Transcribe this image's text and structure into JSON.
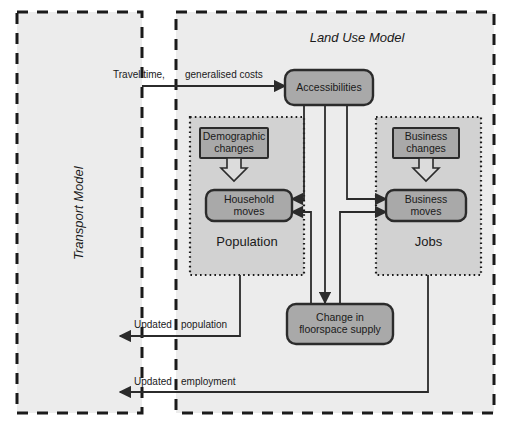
{
  "diagram": {
    "containers": [
      {
        "id": "transport-model",
        "label": "Transport Model",
        "style": "dashed",
        "orientation": "vertical"
      },
      {
        "id": "land-use-model",
        "label": "Land Use Model",
        "style": "dashed",
        "orientation": "horizontal"
      }
    ],
    "subzones": [
      {
        "id": "population",
        "label": "Population",
        "style": "dotted"
      },
      {
        "id": "jobs",
        "label": "Jobs",
        "style": "dotted"
      }
    ],
    "nodes": [
      {
        "id": "accessibilities",
        "label": "Accessibilities",
        "shape": "rounded"
      },
      {
        "id": "demographic-changes",
        "label_line1": "Demographic",
        "label_line2": "changes",
        "shape": "rect"
      },
      {
        "id": "household-moves",
        "label_line1": "Household",
        "label_line2": "moves",
        "shape": "rounded"
      },
      {
        "id": "business-changes",
        "label_line1": "Business",
        "label_line2": "changes",
        "shape": "rect"
      },
      {
        "id": "business-moves",
        "label_line1": "Business",
        "label_line2": "moves",
        "shape": "rounded"
      },
      {
        "id": "change-in-floorspace-supply",
        "label_line1": "Change in",
        "label_line2": "floorspace supply",
        "shape": "rounded"
      }
    ],
    "flows": [
      {
        "id": "travel-time-costs",
        "label_part1": "Travel time,",
        "label_part2": "generalised costs",
        "from": "transport-model",
        "to": "accessibilities"
      },
      {
        "id": "updated-population",
        "label_part1": "Updated",
        "label_part2": "population",
        "from": "population",
        "to": "transport-model"
      },
      {
        "id": "updated-employment",
        "label_part1": "Updated",
        "label_part2": "employment",
        "from": "jobs",
        "to": "transport-model"
      }
    ],
    "colors": {
      "node_fill": "#a9a9a9",
      "node_stroke": "#2b2b2b",
      "container_fill": "#ececec",
      "container_stroke": "#1a1a1a",
      "zone_fill": "#d2d2d2",
      "zone_stroke": "#1a1a1a",
      "line": "#2b2b2b",
      "text": "#1a1a1a",
      "background": "#ffffff"
    }
  }
}
